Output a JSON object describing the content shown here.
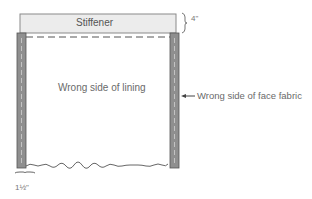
{
  "diagram": {
    "stiffener": {
      "label": "Stiffener",
      "fill": "#ececec",
      "stroke": "#8a8a8a"
    },
    "lining": {
      "label": "Wrong side of lining"
    },
    "face_fabric": {
      "label": "Wrong side of face fabric",
      "strip_fill": "#8f8f8f"
    },
    "dimensions": {
      "stiffener_height": "4\"",
      "side_width": "1½\""
    }
  }
}
